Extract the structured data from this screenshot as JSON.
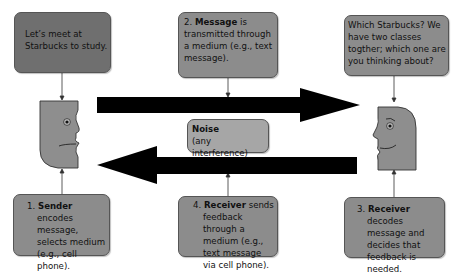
{
  "diagram": {
    "type": "communication-process",
    "sender_speech": {
      "text": "Let’s meet at Starbucks to study."
    },
    "step2": {
      "number": "2.",
      "bold": "Message",
      "text": " is transmitted through a medium (e.g., text message)."
    },
    "receiver_speech": {
      "text": "Which Starbucks? We have two classes togther; which one are you thinking about?"
    },
    "noise": {
      "bold": "Noise",
      "text": "(any interference)"
    },
    "step1": {
      "number": "1.",
      "bold": "Sender",
      "text": " encodes message, selects medium (e.g., cell phone)."
    },
    "step4": {
      "number": "4.",
      "bold": "Receiver",
      "text": " sends feedback through a medium (e.g., text message via cell phone)."
    },
    "step3": {
      "number": "3.",
      "bold": "Receiver",
      "text": " decodes message and decides that feedback is needed."
    },
    "icons": {
      "sender_face": "frowning-face-profile-icon",
      "receiver_face": "smiling-face-profile-icon",
      "message_arrow": "arrow-right-icon",
      "feedback_arrow": "arrow-left-icon"
    },
    "colors": {
      "dark_box": "#6f6f6f",
      "mid_box": "#8c8c8c",
      "noise_box": "#a6a6a6",
      "face": "#8e8e8e",
      "arrow": "#000000"
    }
  }
}
